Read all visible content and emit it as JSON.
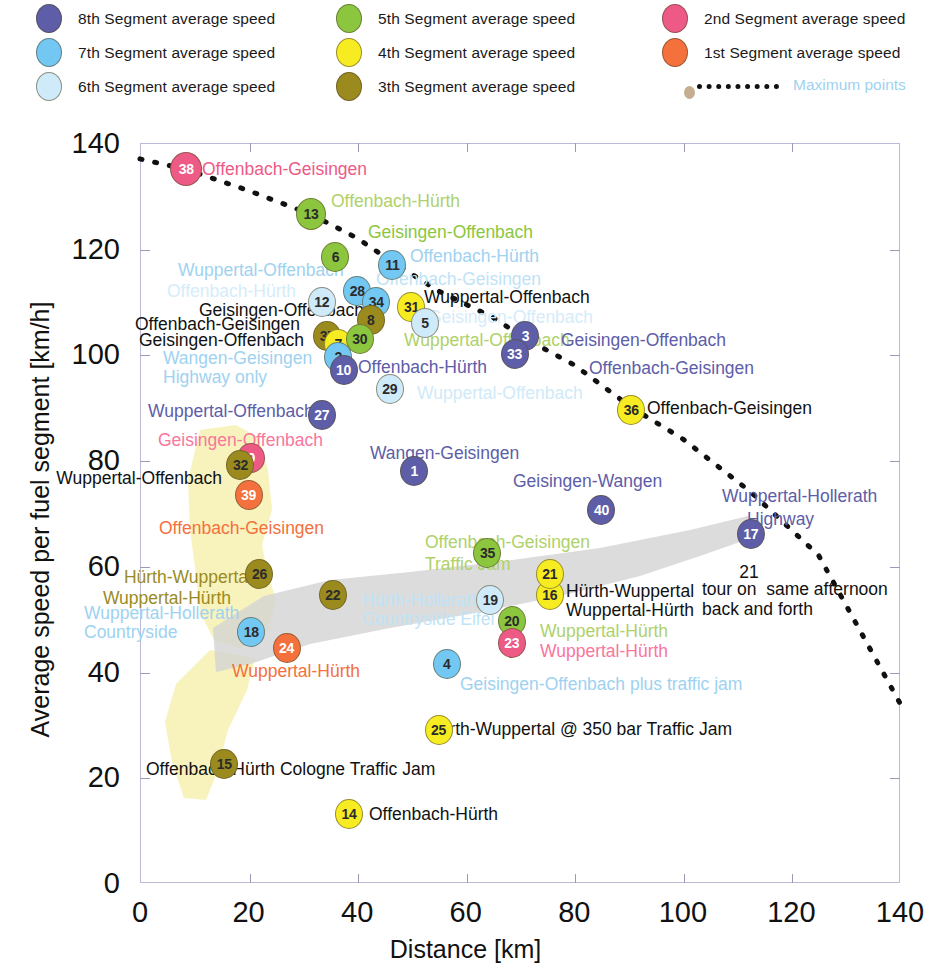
{
  "legend": {
    "items": [
      {
        "label": "8th Segment average speed",
        "color": "#5d5da8",
        "x": 36,
        "y": 4
      },
      {
        "label": "7th Segment average speed",
        "color": "#72c8f2",
        "x": 36,
        "y": 38
      },
      {
        "label": "6th Segment average speed",
        "color": "#cfeaf8",
        "x": 36,
        "y": 72
      },
      {
        "label": "5th Segment average speed",
        "color": "#8cc63e",
        "x": 336,
        "y": 4
      },
      {
        "label": "4th Segment average speed",
        "color": "#f7ec22",
        "x": 336,
        "y": 38
      },
      {
        "label": "3th Segment average speed",
        "color": "#9b8b1f",
        "x": 336,
        "y": 72
      },
      {
        "label": "2nd Segment average speed",
        "color": "#ee5a86",
        "x": 662,
        "y": 4
      },
      {
        "label": "1st Segment average speed",
        "color": "#f4703c",
        "x": 662,
        "y": 38
      }
    ],
    "maximum_points_label": "Maximum points",
    "maximum_points_color": "#9ed2f0"
  },
  "chart_data": {
    "type": "scatter",
    "title": "",
    "xlabel": "Distance [km]",
    "ylabel": "Average speed per fuel segment [km/h]",
    "xlim": [
      0,
      140
    ],
    "ylim": [
      0,
      140
    ],
    "xticks": [
      0,
      20,
      40,
      60,
      80,
      100,
      120,
      140
    ],
    "yticks": [
      0,
      20,
      40,
      60,
      80,
      100,
      120,
      140
    ],
    "grid": false,
    "legend_position": "top",
    "series": [
      {
        "name": "8th Segment average speed",
        "color": "#5d5da8"
      },
      {
        "name": "7th Segment average speed",
        "color": "#72c8f2"
      },
      {
        "name": "6th Segment average speed",
        "color": "#cfeaf8"
      },
      {
        "name": "5th Segment average speed",
        "color": "#8cc63e"
      },
      {
        "name": "4th Segment average speed",
        "color": "#f7ec22"
      },
      {
        "name": "3th Segment average speed",
        "color": "#9b8b1f"
      },
      {
        "name": "2nd Segment average speed",
        "color": "#ee5a86"
      },
      {
        "name": "1st Segment average speed",
        "color": "#f4703c"
      }
    ],
    "points": [
      {
        "id": "38",
        "x": 8.5,
        "y": 135.0,
        "series": "2nd Segment average speed",
        "color": "#ee5a86",
        "r": 16
      },
      {
        "id": "13",
        "x": 31.5,
        "y": 126.5,
        "series": "5th Segment average speed",
        "color": "#8cc63e",
        "r": 15
      },
      {
        "id": "6",
        "x": 36.0,
        "y": 118.5,
        "series": "5th Segment average speed",
        "color": "#8cc63e",
        "r": 14
      },
      {
        "id": "11",
        "x": 46.5,
        "y": 117.0,
        "series": "7th Segment average speed",
        "color": "#72c8f2",
        "r": 14
      },
      {
        "id": "12",
        "x": 33.5,
        "y": 110.0,
        "series": "6th Segment average speed",
        "color": "#cfeaf8",
        "r": 14
      },
      {
        "id": "28",
        "x": 40.0,
        "y": 112.0,
        "series": "7th Segment average speed",
        "color": "#72c8f2",
        "r": 14
      },
      {
        "id": "34",
        "x": 43.5,
        "y": 110.0,
        "series": "7th Segment average speed",
        "color": "#72c8f2",
        "r": 14
      },
      {
        "id": "31",
        "x": 50.0,
        "y": 109.0,
        "series": "4th Segment average speed",
        "color": "#f7ec22",
        "r": 14
      },
      {
        "id": "8",
        "x": 42.5,
        "y": 106.5,
        "series": "3th Segment average speed",
        "color": "#9b8b1f",
        "r": 14
      },
      {
        "id": "5",
        "x": 52.5,
        "y": 106.0,
        "series": "6th Segment average speed",
        "color": "#cfeaf8",
        "r": 14
      },
      {
        "id": "37",
        "x": 34.5,
        "y": 103.5,
        "series": "3th Segment average speed",
        "color": "#9b8b1f",
        "r": 14
      },
      {
        "id": "7",
        "x": 36.5,
        "y": 102.0,
        "series": "4th Segment average speed",
        "color": "#f7ec22",
        "r": 14
      },
      {
        "id": "30",
        "x": 40.5,
        "y": 103.0,
        "series": "5th Segment average speed",
        "color": "#8cc63e",
        "r": 14
      },
      {
        "id": "3",
        "x": 71.0,
        "y": 103.5,
        "series": "8th Segment average speed",
        "color": "#5d5da8",
        "r": 14
      },
      {
        "id": "2",
        "x": 36.5,
        "y": 99.5,
        "series": "7th Segment average speed",
        "color": "#72c8f2",
        "r": 14
      },
      {
        "id": "10",
        "x": 37.5,
        "y": 97.0,
        "series": "8th Segment average speed",
        "color": "#5d5da8",
        "r": 14
      },
      {
        "id": "33",
        "x": 69.0,
        "y": 100.0,
        "series": "8th Segment average speed",
        "color": "#5d5da8",
        "r": 14
      },
      {
        "id": "29",
        "x": 46.0,
        "y": 93.5,
        "series": "6th Segment average speed",
        "color": "#cfeaf8",
        "r": 14
      },
      {
        "id": "27",
        "x": 33.5,
        "y": 88.5,
        "series": "8th Segment average speed",
        "color": "#5d5da8",
        "r": 14
      },
      {
        "id": "36",
        "x": 90.5,
        "y": 89.5,
        "series": "4th Segment average speed",
        "color": "#f7ec22",
        "r": 14
      },
      {
        "id": "9",
        "x": 20.5,
        "y": 80.5,
        "series": "2nd Segment average speed",
        "color": "#ee5a86",
        "r": 14
      },
      {
        "id": "32",
        "x": 18.5,
        "y": 79.0,
        "series": "3th Segment average speed",
        "color": "#9b8b1f",
        "r": 14
      },
      {
        "id": "39",
        "x": 20.0,
        "y": 73.5,
        "series": "1st Segment average speed",
        "color": "#f4703c",
        "r": 14
      },
      {
        "id": "1",
        "x": 50.5,
        "y": 78.0,
        "series": "8th Segment average speed",
        "color": "#5d5da8",
        "r": 14
      },
      {
        "id": "40",
        "x": 85.0,
        "y": 70.5,
        "series": "8th Segment average speed",
        "color": "#5d5da8",
        "r": 14
      },
      {
        "id": "17",
        "x": 112.5,
        "y": 66.0,
        "series": "8th Segment average speed",
        "color": "#5d5da8",
        "r": 14
      },
      {
        "id": "35",
        "x": 64.0,
        "y": 62.5,
        "series": "5th Segment average speed",
        "color": "#8cc63e",
        "r": 14
      },
      {
        "id": "26",
        "x": 22.0,
        "y": 58.5,
        "series": "3th Segment average speed",
        "color": "#9b8b1f",
        "r": 14
      },
      {
        "id": "22",
        "x": 35.5,
        "y": 54.5,
        "series": "3th Segment average speed",
        "color": "#9b8b1f",
        "r": 14
      },
      {
        "id": "19",
        "x": 64.5,
        "y": 53.5,
        "series": "6th Segment average speed",
        "color": "#cfeaf8",
        "r": 14
      },
      {
        "id": "16",
        "x": 75.5,
        "y": 54.5,
        "series": "4th Segment average speed",
        "color": "#f7ec22",
        "r": 14
      },
      {
        "id": "21",
        "x": 75.5,
        "y": 58.5,
        "series": "4th Segment average speed",
        "color": "#f7ec22",
        "r": 14
      },
      {
        "id": "20",
        "x": 68.5,
        "y": 49.5,
        "series": "5th Segment average speed",
        "color": "#8cc63e",
        "r": 14
      },
      {
        "id": "23",
        "x": 68.5,
        "y": 45.5,
        "series": "2nd Segment average speed",
        "color": "#ee5a86",
        "r": 14
      },
      {
        "id": "18",
        "x": 20.5,
        "y": 47.5,
        "series": "7th Segment average speed",
        "color": "#72c8f2",
        "r": 14
      },
      {
        "id": "24",
        "x": 27.0,
        "y": 44.5,
        "series": "1st Segment average speed",
        "color": "#f4703c",
        "r": 14
      },
      {
        "id": "4",
        "x": 56.5,
        "y": 41.5,
        "series": "7th Segment average speed",
        "color": "#72c8f2",
        "r": 14
      },
      {
        "id": "25",
        "x": 55.0,
        "y": 29.0,
        "series": "4th Segment average speed",
        "color": "#f7ec22",
        "r": 14
      },
      {
        "id": "15",
        "x": 15.5,
        "y": 22.5,
        "series": "3th Segment average speed",
        "color": "#9b8b1f",
        "r": 14
      },
      {
        "id": "14",
        "x": 38.5,
        "y": 13.0,
        "series": "4th Segment average speed",
        "color": "#f7ec22",
        "r": 14
      }
    ],
    "maximum_points_line": {
      "label": "Maximum points",
      "style": "dotted",
      "color": "#111111",
      "x": [
        0,
        8.5,
        20,
        31.5,
        40,
        46.5,
        55,
        65,
        71,
        80,
        90.5,
        100,
        112.5,
        125,
        140
      ],
      "y": [
        137,
        135,
        131,
        126.5,
        122,
        117.5,
        112,
        107,
        103,
        98,
        90,
        84,
        74,
        62,
        34
      ]
    },
    "annotations": [
      {
        "text": "Offenbach-Geisingen",
        "x": 202,
        "y": 169,
        "color": "#ee5a86",
        "align": "left",
        "size": 17.5
      },
      {
        "text": "Offenbach-Hürth",
        "x": 331,
        "y": 201,
        "color": "#aed16a",
        "align": "left",
        "size": 17.5
      },
      {
        "text": "Geisingen-Offenbach",
        "x": 368,
        "y": 232,
        "color": "#8cc63e",
        "align": "left",
        "size": 17.5
      },
      {
        "text": "Offenbach-Hürth",
        "x": 410,
        "y": 256,
        "color": "#9ed2f0",
        "align": "left",
        "size": 17.5
      },
      {
        "text": "Wuppertal-Offenbach",
        "x": 178,
        "y": 270,
        "color": "#9ed2f0",
        "align": "left",
        "size": 17.5
      },
      {
        "text": "Offenbach-Geisingen",
        "x": 376,
        "y": 279,
        "color": "#bfe3f6",
        "align": "left",
        "size": 17.5
      },
      {
        "text": "Offenbach-Hürth",
        "x": 167,
        "y": 291,
        "color": "#d5ecfa",
        "align": "left",
        "size": 17.5
      },
      {
        "text": "Wuppertal-Offenbach",
        "x": 424,
        "y": 297,
        "color": "#111111",
        "align": "left",
        "size": 17.5
      },
      {
        "text": "Geisingen-Offenbach",
        "x": 199,
        "y": 310,
        "color": "#111111",
        "align": "left",
        "size": 17.5
      },
      {
        "text": "Offenbach-Geisingen",
        "x": 135,
        "y": 324,
        "color": "#111111",
        "align": "left",
        "size": 17.5
      },
      {
        "text": "Geisingen-Offenbach",
        "x": 428,
        "y": 317,
        "color": "#d5ecfa",
        "align": "left",
        "size": 17.5
      },
      {
        "text": "Geisingen-Offenbach",
        "x": 139,
        "y": 340,
        "color": "#111111",
        "align": "left",
        "size": 17.5
      },
      {
        "text": "Wuppertal-Offenbach",
        "x": 404,
        "y": 340,
        "color": "#aed16a",
        "align": "left",
        "size": 17.5
      },
      {
        "text": "Geisingen-Offenbach",
        "x": 561,
        "y": 340,
        "color": "#5d5da8",
        "align": "left",
        "size": 17.5
      },
      {
        "text": "Wangen-Geisingen",
        "x": 163,
        "y": 358,
        "color": "#9ed2f0",
        "align": "left",
        "size": 17.5
      },
      {
        "text": "Offenbach-Hürth",
        "x": 358,
        "y": 367,
        "color": "#5d5da8",
        "align": "left",
        "size": 17.5
      },
      {
        "text": "Offenbach-Geisingen",
        "x": 589,
        "y": 368,
        "color": "#5d5da8",
        "align": "left",
        "size": 17.5
      },
      {
        "text": "Highway only",
        "x": 163,
        "y": 377,
        "color": "#9ed2f0",
        "align": "left",
        "size": 17.5
      },
      {
        "text": "Wuppertal-Offenbach",
        "x": 417,
        "y": 393,
        "color": "#cfeaf8",
        "align": "left",
        "size": 17.5
      },
      {
        "text": "Offenbach-Geisingen",
        "x": 647,
        "y": 408,
        "color": "#111111",
        "align": "left",
        "size": 17.5
      },
      {
        "text": "Wuppertal-Offenbach",
        "x": 148,
        "y": 411,
        "color": "#5d5da8",
        "align": "left",
        "size": 17.5
      },
      {
        "text": "Geisingen-Offenbach",
        "x": 158,
        "y": 440,
        "color": "#f9769c",
        "align": "left",
        "size": 17.5
      },
      {
        "text": "Wangen-Geisingen",
        "x": 370,
        "y": 453,
        "color": "#5d5da8",
        "align": "left",
        "size": 17.5
      },
      {
        "text": "Wuppertal-Offenbach",
        "x": 222,
        "y": 478,
        "color": "#111111",
        "align": "right",
        "size": 17.5
      },
      {
        "text": "Geisingen-Wangen",
        "x": 513,
        "y": 481,
        "color": "#5d5da8",
        "align": "left",
        "size": 17.5
      },
      {
        "text": "Wuppertal-Hollerath",
        "x": 722,
        "y": 496,
        "color": "#5d5da8",
        "align": "left",
        "size": 17.5
      },
      {
        "text": "Offenbach-Geisingen",
        "x": 159,
        "y": 528,
        "color": "#f4703c",
        "align": "left",
        "size": 17.5
      },
      {
        "text": "Highway",
        "x": 747,
        "y": 519,
        "color": "#5d5da8",
        "align": "left",
        "size": 17.5
      },
      {
        "text": "Offenbach-Geisingen",
        "x": 425,
        "y": 542,
        "color": "#aed16a",
        "align": "left",
        "size": 17.5
      },
      {
        "text": "Traffic Jam",
        "x": 425,
        "y": 564,
        "color": "#aed16a",
        "align": "left",
        "size": 17.5
      },
      {
        "text": "Hürth-Wuppertal",
        "x": 252,
        "y": 577,
        "color": "#9b8b1f",
        "align": "right",
        "size": 17.5
      },
      {
        "text": "21",
        "x": 749,
        "y": 572,
        "color": "#111111",
        "align": "center",
        "size": 17.5
      },
      {
        "text": "Hürth-Wuppertal",
        "x": 566,
        "y": 591,
        "color": "#111111",
        "align": "left",
        "size": 17.5
      },
      {
        "text": "tour on  same afternoon",
        "x": 702,
        "y": 589,
        "color": "#111111",
        "align": "left",
        "size": 17.5
      },
      {
        "text": "Wuppertal-Hürth",
        "x": 231,
        "y": 598,
        "color": "#9b8b1f",
        "align": "right",
        "size": 17.5
      },
      {
        "text": "Hürth-Hollerath",
        "x": 362,
        "y": 600,
        "color": "#bfe3f6",
        "align": "left",
        "size": 17.5
      },
      {
        "text": "Wuppertal-Hürth",
        "x": 566,
        "y": 610,
        "color": "#111111",
        "align": "left",
        "size": 17.5
      },
      {
        "text": "back and forth",
        "x": 702,
        "y": 609,
        "color": "#111111",
        "align": "left",
        "size": 17.5
      },
      {
        "text": "Wuppertal-Hollerath",
        "x": 84,
        "y": 613,
        "color": "#9ed2f0",
        "align": "left",
        "size": 17.5
      },
      {
        "text": "Countryside Eifel",
        "x": 362,
        "y": 619,
        "color": "#bfe3f6",
        "align": "left",
        "size": 17.5
      },
      {
        "text": "Wuppertal-Hürth",
        "x": 540,
        "y": 631,
        "color": "#aed16a",
        "align": "left",
        "size": 17.5
      },
      {
        "text": "Countryside",
        "x": 84,
        "y": 632,
        "color": "#9ed2f0",
        "align": "left",
        "size": 17.5
      },
      {
        "text": "Wuppertal-Hürth",
        "x": 540,
        "y": 651,
        "color": "#f9769c",
        "align": "left",
        "size": 17.5
      },
      {
        "text": "Wuppertal-Hürth",
        "x": 232,
        "y": 671,
        "color": "#f4703c",
        "align": "left",
        "size": 17.5
      },
      {
        "text": "Geisingen-Offenbach plus traffic jam",
        "x": 460,
        "y": 684,
        "color": "#9ed2f0",
        "align": "left",
        "size": 17.5
      },
      {
        "text": "Hürth-Wuppertal @ 350 bar Traffic Jam",
        "x": 427,
        "y": 729,
        "color": "#111111",
        "align": "left",
        "size": 17.5
      },
      {
        "text": "Offenbach-Hürth Cologne Traffic Jam",
        "x": 146,
        "y": 769,
        "color": "#111111",
        "align": "left",
        "size": 17.5
      },
      {
        "text": "Offenbach-Hürth",
        "x": 369,
        "y": 814,
        "color": "#111111",
        "align": "left",
        "size": 17.5
      }
    ],
    "shaded_regions": [
      {
        "name": "yellow-highlight-upper",
        "color": "#f7f0b0"
      },
      {
        "name": "yellow-highlight-lower",
        "color": "#f7f0b0"
      },
      {
        "name": "gray-band",
        "color": "#d3d3d3"
      }
    ]
  }
}
